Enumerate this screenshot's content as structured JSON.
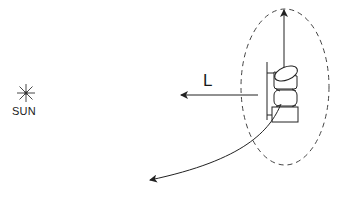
{
  "diagram": {
    "sun": {
      "label": "SUN",
      "icon": "sun-star-icon"
    },
    "force_vector": {
      "label": "L",
      "direction": "left"
    },
    "spacecraft": {
      "icon": "spacecraft-icon"
    },
    "orbit": {
      "style": "dashed-ellipse"
    },
    "vertical_arrow": {
      "direction": "up"
    },
    "trajectory_arrow": {
      "direction": "down-left"
    },
    "colors": {
      "stroke": "#222222",
      "dashed": "#444444",
      "background": "#ffffff"
    }
  }
}
